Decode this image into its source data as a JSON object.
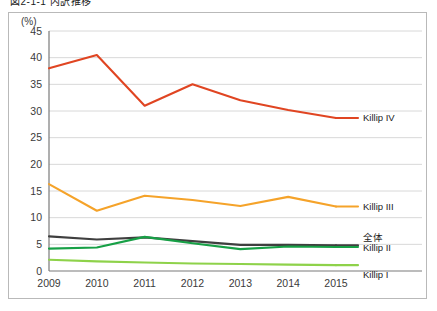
{
  "figure": {
    "caption": "図2-1-1 内訳推移"
  },
  "chart_data": {
    "type": "line",
    "title": "",
    "subtitle": "",
    "xlabel": "",
    "ylabel": "(%)",
    "unit_label": "(%)",
    "grid": "horizontal",
    "legend_position": "right-inline",
    "categories": [
      "2009",
      "2010",
      "2011",
      "2012",
      "2013",
      "2014",
      "2015"
    ],
    "x": [
      2009,
      2010,
      2011,
      2012,
      2013,
      2014,
      2015
    ],
    "ylim": [
      0,
      45
    ],
    "yticks": [
      0,
      5,
      10,
      15,
      20,
      25,
      30,
      35,
      40,
      45
    ],
    "ytick_labels": [
      "0",
      "5",
      "10",
      "15",
      "20",
      "25",
      "30",
      "35",
      "40",
      "45"
    ],
    "series": [
      {
        "name": "Killip IV",
        "color": "#e04522",
        "label": "Killip IV",
        "values": [
          38.0,
          40.5,
          31.0,
          35.0,
          32.0,
          30.2,
          28.7
        ]
      },
      {
        "name": "Killip III",
        "color": "#f5a32a",
        "label": "Killip III",
        "values": [
          16.3,
          11.3,
          14.1,
          13.3,
          12.2,
          13.9,
          12.1
        ]
      },
      {
        "name": "全体",
        "color": "#3f3f3f",
        "label": "全体",
        "values": [
          6.5,
          5.9,
          6.3,
          5.6,
          4.9,
          4.9,
          4.8
        ]
      },
      {
        "name": "Killip II",
        "color": "#17a046",
        "label": "Killip II",
        "values": [
          4.2,
          4.4,
          6.4,
          5.2,
          4.1,
          4.6,
          4.5
        ]
      },
      {
        "name": "Killip I",
        "color": "#8ed24a",
        "label": "Killip I",
        "values": [
          2.1,
          1.8,
          1.6,
          1.4,
          1.3,
          1.2,
          1.1
        ]
      }
    ]
  }
}
